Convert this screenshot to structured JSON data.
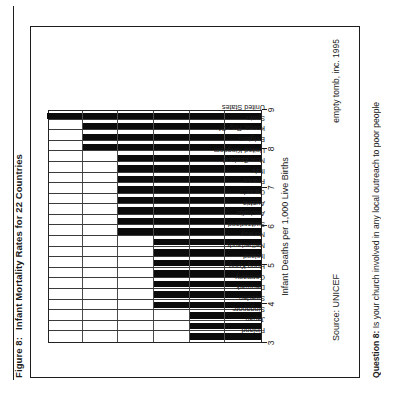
{
  "figure": {
    "number_label": "Figure 8:",
    "title": "Infant Mortality Rates for 22 Countries",
    "source": "Source: UNICEF",
    "credit": "empty tomb, inc. 1995",
    "question_label": "Question 8:",
    "question_text": "Is your church involved in any local outreach to poor people"
  },
  "chart_data": {
    "type": "bar",
    "title": "Infant Mortality Rates for 22 Countries",
    "xlabel": "",
    "ylabel": "Infant Deaths per 1,000 Live Births",
    "ylim": [
      3,
      9
    ],
    "yticks": [
      3,
      4,
      5,
      6,
      7,
      8,
      9
    ],
    "ytick_labels": [
      "3",
      "4",
      "5",
      "6",
      "7",
      "8",
      "9"
    ],
    "grid": true,
    "legend": "none",
    "orientation": "vertical-bars-rotated-page",
    "categories": [
      "Finland",
      "Japan",
      "Singapore",
      "Sweden",
      "Denmark",
      "Germany",
      "Hong Kong",
      "Ireland",
      "Netherlands",
      "Norway",
      "Switzerland",
      "Australia",
      "Austria",
      "Canada",
      "France",
      "Italy",
      "New Zealand",
      "United Kingdom",
      "Belgium",
      "Korea, Rep Of",
      "Spain",
      "United States"
    ],
    "values": [
      5,
      5,
      5,
      6,
      6,
      6,
      6,
      6,
      6,
      6,
      7,
      7,
      7,
      7,
      7,
      7,
      7,
      7,
      8,
      8,
      8,
      9
    ],
    "bar_color": "#0b0b0b"
  }
}
